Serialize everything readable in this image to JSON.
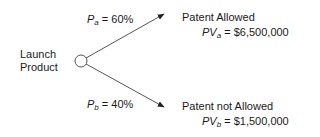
{
  "diagram": {
    "type": "decision-tree",
    "root": {
      "label_line1": "Launch",
      "label_line2": "Product",
      "node_shape": "circle"
    },
    "branches": [
      {
        "prob_symbol": "P",
        "prob_sub": "a",
        "prob_value": " = 60%",
        "outcome": "Patent Allowed",
        "pv_symbol": "PV",
        "pv_sub": "a",
        "pv_value": " = $6,500,000"
      },
      {
        "prob_symbol": "P",
        "prob_sub": "b",
        "prob_value": " = 40%",
        "outcome": "Patent not Allowed",
        "pv_symbol": "PV",
        "pv_sub": "b",
        "pv_value": " = $1,500,000"
      }
    ],
    "colors": {
      "line": "#555555",
      "text": "#1a1a1a",
      "background": "#ffffff"
    }
  }
}
